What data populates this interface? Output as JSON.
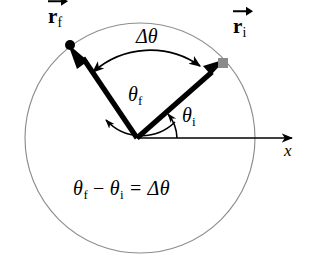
{
  "figure": {
    "type": "physics-diagram",
    "background": "#ffffff"
  },
  "colors": {
    "circle_stroke": "#8e8e8e",
    "vector": "#000000",
    "axis": "#000000",
    "point_final": "#000000",
    "point_initial": "#8a8a8a",
    "text": "#1a1a1a"
  },
  "geometry": {
    "center": [
      140,
      138
    ],
    "radius": 115,
    "origin": [
      137,
      138
    ],
    "vector_initial": {
      "tip": [
        223,
        63
      ],
      "angle_deg": 41
    },
    "vector_final": {
      "tip": [
        70,
        45
      ],
      "angle_deg": 133
    },
    "axis_end": [
      300,
      138
    ]
  },
  "labels": {
    "r_final": {
      "symbol": "r",
      "subscript": "f",
      "vector": true
    },
    "r_initial": {
      "symbol": "r",
      "subscript": "i",
      "vector": true
    },
    "delta_theta": {
      "text": "Δθ"
    },
    "theta_final": {
      "symbol": "θ",
      "subscript": "f"
    },
    "theta_initial": {
      "symbol": "θ",
      "subscript": "i"
    },
    "x_axis": {
      "text": "x"
    }
  },
  "equation": {
    "theta_f": "θ",
    "sub_f": "f",
    "minus": "−",
    "theta_i": "θ",
    "sub_i": "i",
    "equals": "=",
    "delta_theta": "Δθ",
    "plain": "θf − θi = Δθ"
  },
  "markers": {
    "final_point_shape": "filled-circle",
    "initial_point_shape": "filled-square"
  }
}
